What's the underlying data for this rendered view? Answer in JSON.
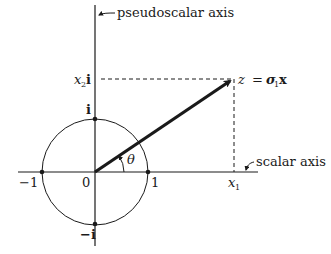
{
  "diagram": {
    "type": "complex-plane / geometric algebra spinor diagram",
    "axes": {
      "vertical_label": "pseudoscalar axis",
      "horizontal_label": "scalar axis"
    },
    "circle": {
      "description": "unit circle",
      "points": {
        "minus_one": "−1",
        "one": "1",
        "i": "i",
        "minus_i": "−i"
      }
    },
    "origin_label": "0",
    "angle_label": "θ",
    "vector": {
      "z_label": "z",
      "equals": "=",
      "sigma": "σ",
      "sigma_sub": "1",
      "x_bold": "x"
    },
    "projections": {
      "x1_main": "x",
      "x1_sub": "1",
      "x2_main": "x",
      "x2_sub": "2",
      "x2_i": "i"
    },
    "colors": {
      "ink": "#1a1a1a",
      "background": "#ffffff"
    }
  }
}
